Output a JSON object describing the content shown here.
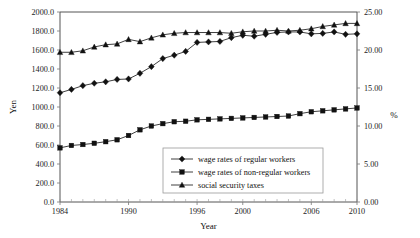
{
  "chart_data": {
    "type": "line",
    "title": "",
    "xlabel": "Year",
    "ylabel": "Yen",
    "y2label": "%",
    "xlim": [
      1984,
      2010
    ],
    "ylim": [
      0,
      2000
    ],
    "y2lim": [
      0,
      25
    ],
    "grid": false,
    "legend_position": "bottom-center",
    "x_ticklabels": [
      "1984",
      "1990",
      "1996",
      "2000",
      "2006",
      "2010"
    ],
    "x_tickvalues": [
      1984,
      1990,
      1996,
      2000,
      2006,
      2010
    ],
    "x_minor_step": 1,
    "y_ticklabels": [
      "0.0",
      "200.0",
      "400.0",
      "600.0",
      "800.0",
      "1000.0",
      "1200.0",
      "1400.0",
      "1600.0",
      "1800.0",
      "2000.0"
    ],
    "y_tickvalues": [
      0,
      200,
      400,
      600,
      800,
      1000,
      1200,
      1400,
      1600,
      1800,
      2000
    ],
    "y2_ticklabels": [
      "0.00",
      "5.00",
      "10.00",
      "15.00",
      "20.00",
      "25.00"
    ],
    "y2_tickvalues": [
      0,
      5,
      10,
      15,
      20,
      25
    ],
    "x": [
      1984,
      1985,
      1986,
      1987,
      1988,
      1989,
      1990,
      1991,
      1992,
      1993,
      1994,
      1995,
      1996,
      1997,
      1998,
      1999,
      2000,
      2001,
      2002,
      2003,
      2004,
      2005,
      2006,
      2007,
      2008,
      2009,
      2010
    ],
    "series": [
      {
        "name": "wage rates of regular workers",
        "marker": "diamond",
        "axis": "left",
        "unit": "Yen",
        "values": [
          1150,
          1185,
          1225,
          1250,
          1265,
          1290,
          1295,
          1355,
          1425,
          1510,
          1545,
          1585,
          1680,
          1685,
          1690,
          1730,
          1755,
          1745,
          1765,
          1785,
          1790,
          1790,
          1770,
          1775,
          1790,
          1765,
          1770
        ]
      },
      {
        "name": "wage rates of non-regular workers",
        "marker": "square",
        "axis": "left",
        "unit": "Yen",
        "values": [
          570,
          595,
          605,
          618,
          635,
          655,
          700,
          760,
          800,
          825,
          845,
          850,
          865,
          870,
          875,
          880,
          885,
          890,
          895,
          900,
          905,
          930,
          950,
          960,
          970,
          980,
          990
        ]
      },
      {
        "name": "social security taxes",
        "marker": "triangle",
        "axis": "right",
        "unit": "%",
        "values": [
          19.7,
          19.7,
          19.9,
          20.4,
          20.7,
          20.8,
          21.4,
          21.1,
          21.6,
          22.0,
          22.2,
          22.3,
          22.3,
          22.3,
          22.3,
          22.2,
          22.4,
          22.5,
          22.5,
          22.6,
          22.5,
          22.6,
          22.8,
          23.1,
          23.3,
          23.5,
          23.5
        ]
      }
    ],
    "legend": [
      {
        "label": "wage rates of regular workers",
        "marker": "diamond"
      },
      {
        "label": "wage rates of non-regular workers",
        "marker": "square"
      },
      {
        "label": "social security taxes",
        "marker": "triangle"
      }
    ]
  }
}
